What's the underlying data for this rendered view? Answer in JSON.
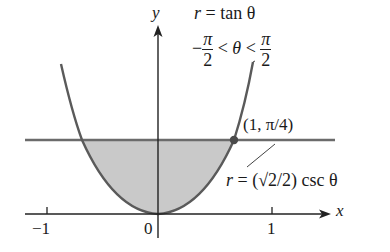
{
  "figure": {
    "axes": {
      "x_label": "x",
      "y_label": "y",
      "ticks": [
        {
          "value": "−1",
          "px": 47
        },
        {
          "value": "0",
          "px": 158
        },
        {
          "value": "1",
          "px": 272
        }
      ]
    },
    "curve_equation": {
      "lhs": "r",
      "eq": "=",
      "rhs": "tan θ"
    },
    "domain_constraint": {
      "minus": "−",
      "pi": "π",
      "two": "2",
      "lt1": "<",
      "theta": "θ",
      "lt2": "<"
    },
    "line_equation": {
      "lhs": "r",
      "eq": "=",
      "rhs": "(√2/2) csc θ"
    },
    "intersection_point": {
      "label": "(1, π/4)"
    },
    "colors": {
      "curve": "#5a5a5a",
      "line": "#6b6b6b",
      "shading": "#c8c8c8",
      "axis": "#222222"
    }
  }
}
